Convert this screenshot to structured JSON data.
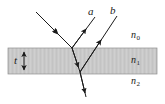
{
  "figure": {
    "type": "thin-film-interference-diagram",
    "width": 165,
    "height": 104,
    "background_color": "#ffffff",
    "stroke_color": "#1a1a1a"
  },
  "film": {
    "fill_color": "#c9c9c9",
    "edge_color": "#8c8c8c",
    "top_y": 48,
    "bottom_y": 74,
    "left_x": 8,
    "right_x": 157
  },
  "labels": {
    "ray_a": "a",
    "ray_b": "b",
    "index_above": "n",
    "index_above_sub": "0",
    "index_film": "n",
    "index_film_sub": "1",
    "index_below": "n",
    "index_below_sub": "2",
    "thickness": "t"
  },
  "rays": {
    "incident": {
      "name": "incident-ray",
      "from": [
        36,
        12
      ],
      "to": [
        72,
        48
      ],
      "arrow_at": [
        56,
        32
      ]
    },
    "reflected_a": {
      "name": "reflected-ray-a",
      "from": [
        72,
        48
      ],
      "to": [
        95,
        17
      ],
      "arrow_at": [
        85,
        30
      ]
    },
    "refracted": {
      "name": "refracted-ray-in-film",
      "from": [
        72,
        48
      ],
      "to": [
        80,
        72
      ],
      "arrow_at": [
        78,
        66
      ]
    },
    "internal_reflected_b": {
      "name": "internally-reflected-ray-b",
      "from": [
        80,
        72
      ],
      "to": [
        117,
        16
      ],
      "arrow_at": [
        101,
        40
      ]
    },
    "transmitted": {
      "name": "transmitted-ray",
      "from": [
        80,
        72
      ],
      "to": [
        86,
        97
      ],
      "arrow_at": [
        85,
        93
      ]
    },
    "thickness_arrow": {
      "name": "thickness-double-arrow",
      "x": 24,
      "top_y": 49,
      "bottom_y": 73
    }
  }
}
